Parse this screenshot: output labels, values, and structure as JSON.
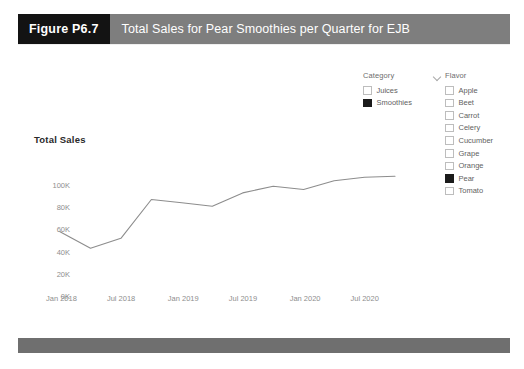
{
  "figure": {
    "tag": "Figure P6.7",
    "title": "Total Sales for Pear Smoothies per Quarter for EJB",
    "tag_bg": "#131313",
    "title_bg": "#7e7e7e",
    "footer_bg": "#6f6f6f"
  },
  "chart_data": {
    "type": "line",
    "title": "Total Sales",
    "xlabel": "",
    "ylabel": "Total Sales",
    "ylim": [
      0,
      110000
    ],
    "ytick_labels": [
      "0K",
      "20K",
      "40K",
      "60K",
      "80K",
      "100K"
    ],
    "ytick_values": [
      0,
      20000,
      40000,
      60000,
      80000,
      100000
    ],
    "xtick_labels": [
      "Jan 2018",
      "Jul 2018",
      "Jan 2019",
      "Jul 2019",
      "Jan 2020",
      "Jul 2020"
    ],
    "grid": false,
    "legend": "none",
    "line_color": "#8d8d8d",
    "x": [
      "Jan 2018",
      "Apr 2018",
      "Jul 2018",
      "Oct 2018",
      "Jan 2019",
      "Apr 2019",
      "Jul 2019",
      "Oct 2019",
      "Jan 2020",
      "Apr 2020",
      "Jul 2020",
      "Oct 2020"
    ],
    "series": [
      {
        "name": "Pear Smoothies",
        "values": [
          58000,
          43000,
          52000,
          87000,
          84000,
          81000,
          93000,
          99000,
          96000,
          104000,
          107000,
          108000
        ]
      }
    ]
  },
  "slicers": {
    "category": {
      "header": "Category",
      "header_icon": "chevron-down-icon",
      "items": [
        {
          "label": "Juices",
          "checked": false
        },
        {
          "label": "Smoothies",
          "checked": true
        }
      ]
    },
    "flavor": {
      "header": "Flavor",
      "items": [
        {
          "label": "Apple",
          "checked": false
        },
        {
          "label": "Beet",
          "checked": false
        },
        {
          "label": "Carrot",
          "checked": false
        },
        {
          "label": "Celery",
          "checked": false
        },
        {
          "label": "Cucumber",
          "checked": false
        },
        {
          "label": "Grape",
          "checked": false
        },
        {
          "label": "Orange",
          "checked": false
        },
        {
          "label": "Pear",
          "checked": true
        },
        {
          "label": "Tomato",
          "checked": false
        }
      ]
    }
  }
}
